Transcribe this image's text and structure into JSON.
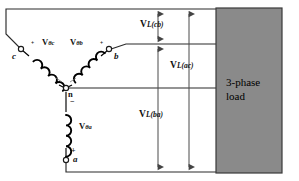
{
  "diagram": {
    "colors": {
      "wire": "#2b2b2b",
      "coil": "#000000",
      "dimension_line": "#555555",
      "load_fill": "#8a8a8a",
      "load_stroke": "#3a3a3a",
      "background": "#ffffff",
      "text": "#111111"
    },
    "load_block": {
      "line1": "3-phase",
      "line2": "load"
    },
    "phase_sources": [
      {
        "id": "phase-c",
        "label_main": "V",
        "label_sub": "θc",
        "terminal": "c",
        "polarity_near_terminal": "+",
        "polarity_near_neutral": "−"
      },
      {
        "id": "phase-b",
        "label_main": "V",
        "label_sub": "θb",
        "terminal": "b",
        "polarity_near_terminal": "+",
        "polarity_near_neutral": "−"
      },
      {
        "id": "phase-a",
        "label_main": "V",
        "label_sub": "θa",
        "terminal": "a",
        "polarity_near_terminal": "+",
        "polarity_near_neutral": "−"
      }
    ],
    "neutral_label": "n",
    "terminals": {
      "c": "c",
      "b": "b",
      "a": "a"
    },
    "polarity_marks": {
      "c_mark": "+",
      "b_mark": "+",
      "a_plus": "+",
      "n_minus": "−"
    },
    "line_voltages": [
      {
        "id": "v-l-cb",
        "label_main": "V",
        "label_sub": "L(cb)"
      },
      {
        "id": "v-l-ac",
        "label_main": "V",
        "label_sub": "L(ac)"
      },
      {
        "id": "v-l-ba",
        "label_main": "V",
        "label_sub": "L(ba)"
      }
    ]
  }
}
